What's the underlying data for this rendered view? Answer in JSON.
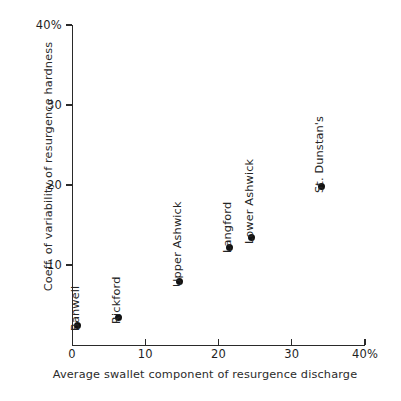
{
  "chart_data": {
    "type": "scatter",
    "title": "",
    "xlabel": "Average swallet component of resurgence discharge",
    "ylabel": "Coeff. of variability of resurgence hardness",
    "xlim": [
      0,
      40
    ],
    "ylim": [
      0,
      40
    ],
    "grid": false,
    "legend": "none",
    "x_tick_labels": [
      "0",
      "10",
      "20",
      "30",
      "40%"
    ],
    "x_ticks": [
      0,
      10,
      20,
      30,
      40
    ],
    "y_tick_labels": [
      "10",
      "20",
      "30",
      "40%"
    ],
    "y_ticks": [
      10,
      20,
      30,
      40
    ],
    "points": [
      {
        "label": "Banwell",
        "x": 0.8,
        "y": 2.5
      },
      {
        "label": "Rickford",
        "x": 6.3,
        "y": 3.4
      },
      {
        "label": "Upper Ashwick",
        "x": 14.7,
        "y": 8.0
      },
      {
        "label": "Langford",
        "x": 21.5,
        "y": 12.2
      },
      {
        "label": "Lower Ashwick",
        "x": 24.5,
        "y": 13.4
      },
      {
        "label": "St. Dunstan's",
        "x": 34.0,
        "y": 19.8
      }
    ]
  },
  "colors": {
    "point": "#111111",
    "axis": "#2a2a2a",
    "text": "#242424",
    "background": "#ffffff"
  }
}
